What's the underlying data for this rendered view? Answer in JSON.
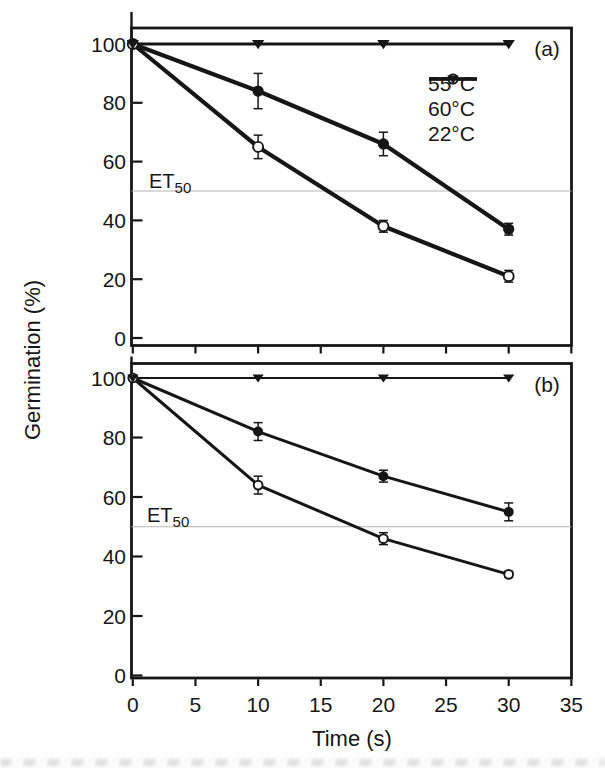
{
  "colors": {
    "line": "#161616",
    "axis": "#161616",
    "reference_line": "#b3b3b3",
    "background": "#ffffff",
    "text": "#161616"
  },
  "chart_data": [
    {
      "type": "line",
      "panel_label": "(a)",
      "ylabel": "Germination (%)",
      "xlabel": "Time (s)",
      "x": [
        0,
        10,
        20,
        30
      ],
      "xlim": [
        0,
        35
      ],
      "ylim": [
        0,
        105
      ],
      "xticks": [
        0,
        5,
        10,
        15,
        20,
        25,
        30,
        35
      ],
      "yticks": [
        0,
        20,
        40,
        60,
        80,
        100
      ],
      "grid": false,
      "legend_position": "top-right",
      "series": [
        {
          "name": "55°C",
          "marker": "filled-circle",
          "values": [
            100,
            84,
            66,
            37
          ],
          "errors": [
            0,
            6,
            4,
            2
          ]
        },
        {
          "name": "60°C",
          "marker": "open-circle",
          "values": [
            100,
            65,
            38,
            21
          ],
          "errors": [
            0,
            4,
            2,
            2
          ]
        },
        {
          "name": "22°C",
          "marker": "filled-triangle",
          "values": [
            100,
            100,
            100,
            100
          ],
          "errors": [
            0,
            0,
            0,
            0
          ]
        }
      ],
      "reference_line": {
        "label": "ET",
        "label_sub": "50",
        "value": 50
      }
    },
    {
      "type": "line",
      "panel_label": "(b)",
      "ylabel": "Germination (%)",
      "xlabel": "Time (s)",
      "x": [
        0,
        10,
        20,
        30
      ],
      "xlim": [
        0,
        35
      ],
      "ylim": [
        0,
        105
      ],
      "xticks": [
        0,
        5,
        10,
        15,
        20,
        25,
        30,
        35
      ],
      "yticks": [
        0,
        20,
        40,
        60,
        80,
        100
      ],
      "grid": false,
      "legend_position": "none",
      "series": [
        {
          "name": "55°C",
          "marker": "filled-circle",
          "values": [
            100,
            82,
            67,
            55
          ],
          "errors": [
            0,
            3,
            2,
            3
          ]
        },
        {
          "name": "60°C",
          "marker": "open-circle",
          "values": [
            100,
            64,
            46,
            34
          ],
          "errors": [
            0,
            3,
            2,
            1
          ]
        },
        {
          "name": "22°C",
          "marker": "filled-triangle",
          "values": [
            100,
            100,
            100,
            100
          ],
          "errors": [
            0,
            0,
            0,
            0
          ]
        }
      ],
      "reference_line": {
        "label": "ET",
        "label_sub": "50",
        "value": 50
      }
    }
  ]
}
